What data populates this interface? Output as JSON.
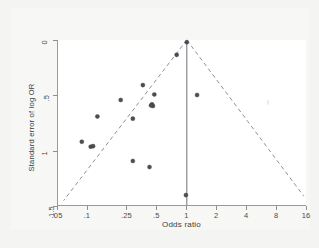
{
  "figure": {
    "background_color": "#f4f4f3",
    "plot_background_color": "#ffffff",
    "axis_color": "#9a9a9a",
    "point_color": "#4d4d55",
    "funnel_line_color": "#8e8e96",
    "reference_line_color": "#7d7d85"
  },
  "chart_data": {
    "type": "scatter",
    "title": "",
    "subtitle": "",
    "xlabel": "Odds ratio",
    "ylabel": "Standard error of log OR",
    "xscale": "log",
    "xlim": [
      0.05,
      16
    ],
    "ylim": [
      0,
      1.5
    ],
    "y_inverted": true,
    "grid": false,
    "legend": null,
    "xticks": [
      0.05,
      0.1,
      0.25,
      0.5,
      1,
      2,
      4,
      8,
      16
    ],
    "xticklabels": [
      ".05",
      ".1",
      ".25",
      ".5",
      "1",
      "2",
      "4",
      "8",
      "16"
    ],
    "yticks": [
      0,
      0.5,
      1,
      1.5
    ],
    "yticklabels": [
      "0",
      ".5",
      "1",
      "1.5"
    ],
    "reference_line": {
      "x": 1,
      "style": "solid",
      "from_y": 0,
      "to_y": 1.5
    },
    "funnel_lines": {
      "style": "dashed",
      "apex": {
        "x": 1,
        "y": 0
      },
      "left_end": {
        "x": 0.057,
        "y": 1.46
      },
      "right_end": {
        "x": 15.2,
        "y": 1.42
      }
    },
    "points": [
      {
        "x": 1.0,
        "y": 0.02
      },
      {
        "x": 0.79,
        "y": 0.135
      },
      {
        "x": 0.36,
        "y": 0.41
      },
      {
        "x": 1.27,
        "y": 0.5
      },
      {
        "x": 0.47,
        "y": 0.495
      },
      {
        "x": 0.215,
        "y": 0.545
      },
      {
        "x": 0.445,
        "y": 0.585
      },
      {
        "x": 0.455,
        "y": 0.6
      },
      {
        "x": 0.435,
        "y": 0.595
      },
      {
        "x": 0.125,
        "y": 0.695
      },
      {
        "x": 0.285,
        "y": 0.715
      },
      {
        "x": 0.087,
        "y": 0.925
      },
      {
        "x": 0.107,
        "y": 0.97
      },
      {
        "x": 0.113,
        "y": 0.965
      },
      {
        "x": 0.285,
        "y": 1.1
      },
      {
        "x": 0.42,
        "y": 1.155
      },
      {
        "x": 0.98,
        "y": 1.41
      }
    ]
  }
}
